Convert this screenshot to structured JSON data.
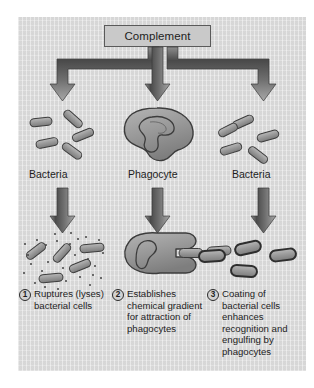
{
  "figure": {
    "title_box": "Complement",
    "background_color": "#dcdcdc",
    "ink_color": "#1d1d1d",
    "cell_fill": "#9a9a9a",
    "cell_stroke": "#3c3c3c"
  },
  "columns": [
    {
      "label": "Bacteria"
    },
    {
      "label": "Phagocyte"
    },
    {
      "label": "Bacteria"
    }
  ],
  "captions": [
    {
      "number": "1",
      "text": "Ruptures (lyses) bacterial cells"
    },
    {
      "number": "2",
      "text": "Establishes chemical gradient for attraction of phagocytes"
    },
    {
      "number": "3",
      "text": "Coating of bacterial cells enhances recognition and engulfing by phagocytes"
    }
  ],
  "icons": {
    "branch_arrow_left": "arrow-down-left-branch-icon",
    "branch_arrow_center": "arrow-down-center-branch-icon",
    "branch_arrow_right": "arrow-down-right-branch-icon",
    "column_arrow": "arrow-down-icon",
    "bacteria_cluster": "bacteria-rods-icon",
    "phagocyte": "phagocyte-cell-icon",
    "lysed_bacteria": "lysed-bacteria-icon",
    "phagocyte_engulfing": "phagocyte-engulfing-icon",
    "coated_bacteria": "coated-bacteria-icon"
  }
}
